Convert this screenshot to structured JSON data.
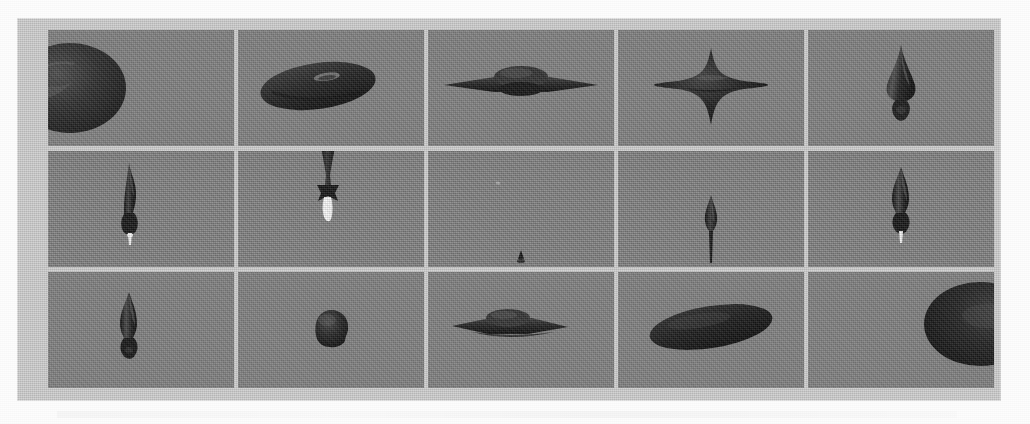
{
  "figure": {
    "domain": "scanned-figure",
    "caption": "",
    "panel_background_color": "#c8c8c8",
    "tile_background_color": "#808080",
    "shape_fill_color": "#1d1d1d",
    "highlight_color": "#f2f2f2",
    "grid": {
      "rows": 3,
      "columns": 5,
      "tile_count": 15
    },
    "tiles": [
      {
        "index": 1,
        "row": 1,
        "column": 1,
        "shape": "large-ellipsoid-clipped-left",
        "description": "Large dark oblate ellipsoid cut off by the left edge of the frame, with a specular crease on its upper-left limb.",
        "position": "left-edge",
        "relative_size": "very-large"
      },
      {
        "index": 2,
        "row": 1,
        "column": 2,
        "shape": "flattened-disk-with-central-dimple",
        "description": "Wide dark lenticular disk seen at a shallow tilt with a small bright dimple near its centre.",
        "position": "centre-left",
        "relative_size": "large"
      },
      {
        "index": 3,
        "row": 1,
        "column": 3,
        "shape": "saucer-with-equatorial-flange",
        "description": "Flying-saucer profile: thin horizontal flange with a low rounded dome at the centre.",
        "position": "centre",
        "relative_size": "medium"
      },
      {
        "index": 4,
        "row": 1,
        "column": 4,
        "shape": "four-pointed-star-cusps",
        "description": "Four-pointed cuspy shape with horizontal and vertical spikes, slightly longer on the horizontal axis.",
        "position": "centre",
        "relative_size": "medium"
      },
      {
        "index": 5,
        "row": 1,
        "column": 5,
        "shape": "spinning-top-with-pointed-apex",
        "description": "Vertical top-shaped body: sharp conical apex, bulging waist and a small knobby foot below.",
        "position": "centre",
        "relative_size": "medium"
      },
      {
        "index": 6,
        "row": 2,
        "column": 1,
        "shape": "elongated-spindle-with-bright-tip",
        "description": "Tall narrow spindle with a pointed top, a constricted neck, a bulb at the bottom and a small bright white tip.",
        "position": "centre",
        "relative_size": "medium"
      },
      {
        "index": 7,
        "row": 2,
        "column": 2,
        "shape": "hourglass-column-with-white-jet",
        "description": "Narrow dark column entering from the top edge, flaring into a skirt and emitting a bright white jet downward.",
        "position": "top-centre",
        "relative_size": "small"
      },
      {
        "index": 8,
        "row": 2,
        "column": 3,
        "shape": "tiny-residual-speck",
        "description": "Almost empty frame; only a minute dark speck remains at the bottom centre.",
        "position": "bottom-centre",
        "relative_size": "very-small"
      },
      {
        "index": 9,
        "row": 2,
        "column": 4,
        "shape": "teardrop-with-thin-stem",
        "description": "Small pointed teardrop body with a thin stem trailing down to the lower frame edge.",
        "position": "centre",
        "relative_size": "small"
      },
      {
        "index": 10,
        "row": 2,
        "column": 5,
        "shape": "spindle-with-bulb-and-bright-tip",
        "description": "Pointed spindle with a narrow waist, rounded lower bulb and a bright white tip at the bottom.",
        "position": "centre",
        "relative_size": "medium"
      },
      {
        "index": 11,
        "row": 3,
        "column": 1,
        "shape": "spindle-with-rounded-foot",
        "description": "Pointed vertical spindle with a tapering neck and a rounded foot, no bright tip.",
        "position": "centre",
        "relative_size": "medium"
      },
      {
        "index": 12,
        "row": 3,
        "column": 2,
        "shape": "compact-lumpy-blob",
        "description": "Small compact roughly spherical lumpy blob.",
        "position": "centre",
        "relative_size": "small"
      },
      {
        "index": 13,
        "row": 3,
        "column": 3,
        "shape": "saucer-with-double-flange",
        "description": "Saucer profile with a broad thin flange and a low dome; a faint second flange below.",
        "position": "centre-left",
        "relative_size": "medium"
      },
      {
        "index": 14,
        "row": 3,
        "column": 4,
        "shape": "broad-tilted-ellipse",
        "description": "Broad dark ellipse tilted slightly nose-up, filling much of the frame width.",
        "position": "centre",
        "relative_size": "large"
      },
      {
        "index": 15,
        "row": 3,
        "column": 5,
        "shape": "large-ellipsoid-clipped-right",
        "description": "Very large dark ellipsoid cut off by the right edge of the frame.",
        "position": "right-edge",
        "relative_size": "very-large"
      }
    ]
  }
}
